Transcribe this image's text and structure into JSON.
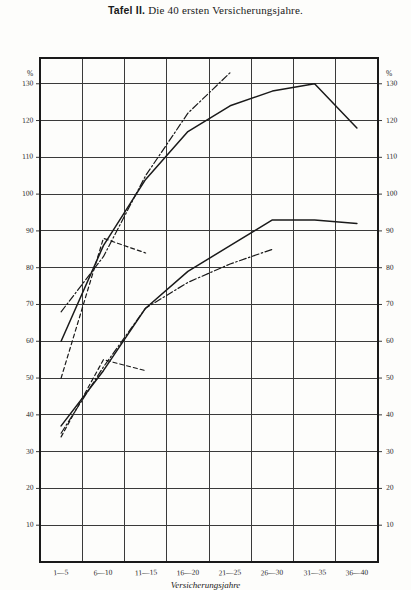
{
  "title": {
    "strong": "Tafel II.",
    "rest": "Die 40 ersten Versicherungsjahre."
  },
  "axes": {
    "left_unit": "%",
    "right_unit": "%",
    "x_axis_title": "Versicherungsjahre",
    "y_ticks": [
      130,
      120,
      110,
      100,
      90,
      80,
      70,
      60,
      50,
      40,
      30,
      20,
      10
    ],
    "y_min": 0,
    "y_max": 137,
    "x_categories": [
      "1—5",
      "6—10",
      "11—15",
      "16—20",
      "21—25",
      "26—30",
      "31—35",
      "36—40"
    ]
  },
  "chart_data": {
    "type": "line",
    "title": "Tafel II. Die 40 ersten Versicherungsjahre.",
    "xlabel": "Versicherungsjahre",
    "ylabel": "%",
    "ylim": [
      0,
      137
    ],
    "grid": true,
    "legend": "none",
    "categories": [
      "1—5",
      "6—10",
      "11—15",
      "16—20",
      "21—25",
      "26—30",
      "31—35",
      "36—40"
    ],
    "series": [
      {
        "name": "upper-solid",
        "style": "solid",
        "values": [
          60,
          86,
          104,
          117,
          124,
          128,
          130,
          118
        ]
      },
      {
        "name": "upper-dashdot",
        "style": "dashdot",
        "values": [
          68,
          83,
          105,
          122,
          133,
          null,
          null,
          null
        ]
      },
      {
        "name": "upper-dashed",
        "style": "dashed",
        "values": [
          50,
          88,
          84,
          null,
          null,
          null,
          null,
          null
        ]
      },
      {
        "name": "lower-solid",
        "style": "solid",
        "values": [
          37,
          52,
          69,
          79,
          86,
          93,
          93,
          92
        ]
      },
      {
        "name": "lower-dashdot",
        "style": "dashdot",
        "values": [
          35,
          53,
          69,
          76,
          81,
          85,
          null,
          null
        ]
      },
      {
        "name": "lower-dashed",
        "style": "dashed",
        "values": [
          34,
          55,
          52,
          null,
          null,
          null,
          null,
          null
        ]
      }
    ]
  },
  "colors": {
    "ink": "#1a1a1a",
    "grid": "#3a3a3a",
    "paper": "#fdfdfb"
  }
}
